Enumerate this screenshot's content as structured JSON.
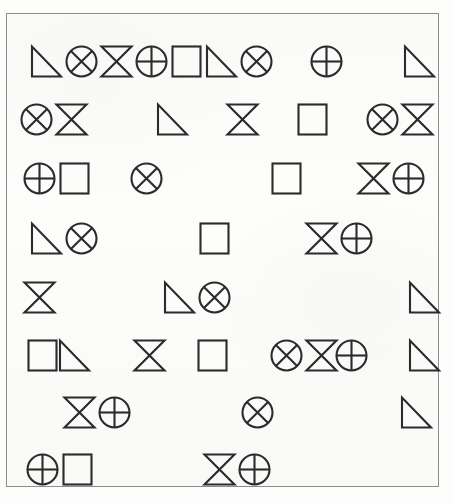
{
  "document": {
    "title": "Shape Grid Puzzle",
    "background_color": "#fdfdfc",
    "ink_color": "#2b2b2b",
    "frame_color": "#8d8d8d"
  },
  "legend": {
    "shapes": [
      {
        "key": "triangle",
        "label": "right triangle"
      },
      {
        "key": "circle-x",
        "label": "circle with X"
      },
      {
        "key": "circle-plus",
        "label": "circle with plus"
      },
      {
        "key": "bowtie",
        "label": "hourglass bowtie"
      },
      {
        "key": "square",
        "label": "square"
      },
      {
        "key": "",
        "label": "empty cell"
      }
    ]
  },
  "grid": {
    "columns": 11,
    "rows": 8,
    "cell_width": 37,
    "cell_height": 44,
    "data": [
      [
        "triangle",
        "circle-x",
        "bowtie",
        "circle-plus",
        "square",
        "triangle",
        "circle-x",
        "",
        "circle-plus",
        "",
        "triangle"
      ],
      [
        "circle-x",
        "bowtie",
        "",
        "triangle",
        "",
        "bowtie",
        "",
        "square",
        "",
        "circle-x",
        "bowtie"
      ],
      [
        "circle-plus",
        "square",
        "",
        "circle-x",
        "",
        "",
        "square",
        "triangle",
        "",
        "bowtie",
        "circle-plus",
        "square"
      ],
      [
        "triangle",
        "circle-x",
        "",
        "",
        "square",
        "triangle",
        "",
        "bowtie",
        "circle-plus",
        "square",
        "",
        "circle-x"
      ],
      [
        "bowtie",
        "",
        "",
        "triangle",
        "circle-x",
        "bowtie",
        "",
        "",
        "triangle",
        "circle-x",
        "circle-plus"
      ],
      [
        "square",
        "triangle",
        "",
        "bowtie",
        "",
        "square",
        "",
        "circle-x",
        "bowtie",
        "circle-plus",
        "",
        "triangle"
      ],
      [
        "",
        "bowtie",
        "circle-plus",
        "",
        "",
        "circle-x",
        "bowtie",
        "",
        "",
        "triangle",
        "circle-x",
        "bowtie"
      ],
      [
        "circle-plus",
        "square",
        "",
        "",
        "bowtie",
        "circle-plus",
        "square",
        "",
        "circle-x",
        "",
        "square"
      ]
    ],
    "row_tops": [
      26,
      84,
      143,
      203,
      262,
      320,
      377,
      434
    ],
    "row_layouts": [
      [
        22,
        57,
        92,
        127,
        162,
        197,
        232,
        null,
        302,
        null,
        395
      ],
      [
        12,
        47,
        null,
        148,
        null,
        218,
        null,
        288,
        null,
        358,
        393
      ],
      [
        15,
        50,
        null,
        122,
        null,
        230,
        262,
        null,
        314,
        349,
        384
      ],
      [
        22,
        57,
        null,
        155,
        190,
        null,
        262,
        297,
        332,
        null,
        414
      ],
      [
        15,
        null,
        120,
        155,
        190,
        null,
        300,
        335,
        400
      ],
      [
        18,
        50,
        null,
        125,
        null,
        188,
        null,
        262,
        297,
        327,
        null,
        400
      ],
      [
        null,
        55,
        90,
        null,
        198,
        233,
        null,
        322,
        357,
        392
      ],
      [
        18,
        53,
        null,
        160,
        195,
        230,
        null,
        300,
        null,
        393
      ]
    ]
  }
}
